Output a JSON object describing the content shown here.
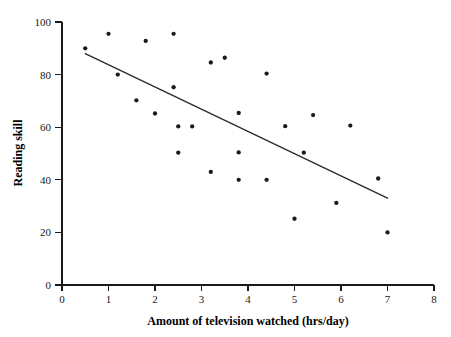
{
  "chart_data": {
    "type": "scatter",
    "title": "",
    "xlabel": "Amount of television watched (hrs/day)",
    "ylabel": "Reading skill",
    "xlim": [
      0,
      8
    ],
    "ylim": [
      0,
      100
    ],
    "xticks": [
      0,
      1,
      2,
      3,
      4,
      5,
      6,
      7,
      8
    ],
    "yticks": [
      0,
      20,
      40,
      60,
      80,
      100
    ],
    "xtick_labels": [
      "0",
      "1",
      "2",
      "3",
      "4",
      "5",
      "6",
      "7",
      "8"
    ],
    "ytick_labels": [
      "0",
      "20",
      "40",
      "60",
      "80",
      "100"
    ],
    "grid": false,
    "legend": false,
    "marker_color": "#1b1b1b",
    "marker_size": 3,
    "line_color": "#2a2a2a",
    "points": [
      {
        "x": 0.5,
        "y": 90.0
      },
      {
        "x": 1.0,
        "y": 95.5
      },
      {
        "x": 1.2,
        "y": 80.0
      },
      {
        "x": 1.6,
        "y": 70.2
      },
      {
        "x": 1.8,
        "y": 92.8
      },
      {
        "x": 2.0,
        "y": 65.2
      },
      {
        "x": 2.4,
        "y": 95.5
      },
      {
        "x": 2.4,
        "y": 75.2
      },
      {
        "x": 2.5,
        "y": 60.3
      },
      {
        "x": 2.5,
        "y": 50.3
      },
      {
        "x": 2.8,
        "y": 60.3
      },
      {
        "x": 3.2,
        "y": 84.6
      },
      {
        "x": 3.2,
        "y": 43.0
      },
      {
        "x": 3.5,
        "y": 86.4
      },
      {
        "x": 3.8,
        "y": 65.4
      },
      {
        "x": 3.8,
        "y": 50.4
      },
      {
        "x": 3.8,
        "y": 40.0
      },
      {
        "x": 4.4,
        "y": 80.4
      },
      {
        "x": 4.4,
        "y": 40.0
      },
      {
        "x": 4.8,
        "y": 60.4
      },
      {
        "x": 5.0,
        "y": 25.2
      },
      {
        "x": 5.2,
        "y": 50.3
      },
      {
        "x": 5.4,
        "y": 64.6
      },
      {
        "x": 5.9,
        "y": 31.2
      },
      {
        "x": 6.2,
        "y": 60.6
      },
      {
        "x": 6.8,
        "y": 40.5
      },
      {
        "x": 7.0,
        "y": 20.0
      }
    ],
    "fit_line": {
      "type": "linear-regression",
      "x_start": 0.5,
      "y_start": 88.0,
      "x_end": 7.0,
      "y_end": 33.0
    },
    "annotations": []
  }
}
